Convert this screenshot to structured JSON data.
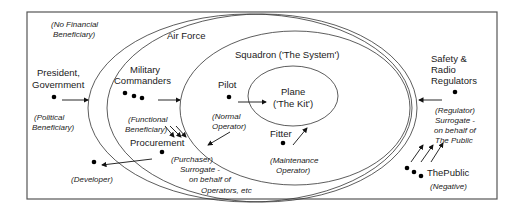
{
  "diagram": {
    "frame_label": "(No Financial Beneficiary)",
    "frame_label_lines": [
      "(No Financial",
      "Beneficiary)"
    ],
    "ellipses": {
      "air_force": "Air Force",
      "squadron": "Squadron ('The System')",
      "plane_lines": [
        "Plane",
        "('The Kit')"
      ]
    },
    "actors": {
      "president": {
        "name_lines": [
          "President,",
          "Government"
        ],
        "role_lines": [
          "(Political",
          "Beneficiary)"
        ]
      },
      "military_commanders": {
        "name_lines": [
          "Military",
          "Commanders"
        ],
        "role_lines": [
          "(Functional",
          "Beneficiary)"
        ]
      },
      "pilot": {
        "name": "Pilot",
        "role_lines": [
          "(Normal",
          "Operator)"
        ]
      },
      "fitter": {
        "name": "Fitter",
        "role_lines": [
          "(Maintenance",
          "Operator)"
        ]
      },
      "procurement": {
        "name": "Procurement",
        "role_lines": [
          "(Purchaser)",
          "Surrogate -",
          "on behalf of",
          "Operators, etc"
        ]
      },
      "developer": {
        "role": "(Developer)"
      },
      "regulators": {
        "name_lines": [
          "Safety &",
          "Radio",
          "Regulators"
        ],
        "role_lines": [
          "(Regulator)",
          "Surrogate -",
          "on behalf of",
          "The Public"
        ]
      },
      "public": {
        "name": "ThePublic",
        "role": "(Negative)"
      }
    }
  }
}
